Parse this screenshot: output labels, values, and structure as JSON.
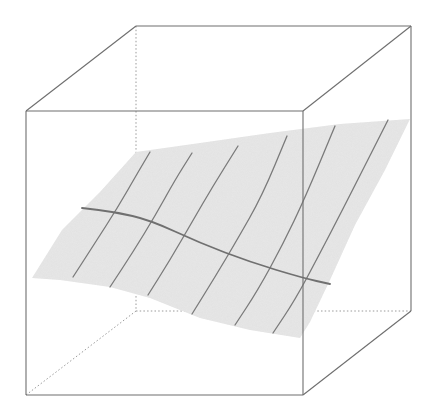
{
  "chart_data": {
    "type": "surface3d",
    "title": "",
    "xlabel": "",
    "ylabel": "",
    "zlabel": "",
    "axes_visible": false,
    "grid": false,
    "legend": null,
    "box": {
      "style": "wireframe",
      "front_top_left": [
        26,
        111
      ],
      "front_top_right": [
        303,
        111
      ],
      "front_bottom_left": [
        26,
        395
      ],
      "front_bottom_right": [
        303,
        395
      ],
      "back_top_left": [
        136,
        26
      ],
      "back_top_right": [
        411,
        26
      ],
      "back_bottom_left": [
        136,
        311
      ],
      "back_bottom_right": [
        411,
        311
      ],
      "hidden_edges": "dotted"
    },
    "surface": {
      "description": "Gently tilted, slightly wavy sheet rising from front-left to back-right",
      "outline": [
        [
          32,
          278
        ],
        [
          62,
          230
        ],
        [
          100,
          192
        ],
        [
          136,
          152
        ],
        [
          200,
          143
        ],
        [
          270,
          133
        ],
        [
          340,
          124
        ],
        [
          410,
          119
        ],
        [
          385,
          170
        ],
        [
          355,
          225
        ],
        [
          330,
          280
        ],
        [
          310,
          322
        ],
        [
          300,
          338
        ],
        [
          250,
          330
        ],
        [
          200,
          318
        ],
        [
          150,
          298
        ],
        [
          110,
          287
        ],
        [
          60,
          280
        ]
      ],
      "meridian_lines": [
        [
          [
            73,
            277
          ],
          [
            95,
            243
          ],
          [
            118,
            207
          ],
          [
            137,
            174
          ],
          [
            150,
            152
          ]
        ],
        [
          [
            110,
            287
          ],
          [
            133,
            252
          ],
          [
            155,
            216
          ],
          [
            175,
            180
          ],
          [
            192,
            153
          ]
        ],
        [
          [
            148,
            295
          ],
          [
            170,
            260
          ],
          [
            192,
            222
          ],
          [
            213,
            186
          ],
          [
            238,
            146
          ]
        ],
        [
          [
            192,
            314
          ],
          [
            215,
            277
          ],
          [
            237,
            240
          ],
          [
            262,
            196
          ],
          [
            287,
            136
          ]
        ],
        [
          [
            235,
            325
          ],
          [
            258,
            290
          ],
          [
            283,
            244
          ],
          [
            305,
            198
          ],
          [
            335,
            126
          ]
        ],
        [
          [
            273,
            333
          ],
          [
            295,
            300
          ],
          [
            318,
            257
          ],
          [
            345,
            205
          ],
          [
            388,
            120
          ]
        ]
      ],
      "main_transverse_line": [
        [
          82,
          208
        ],
        [
          115,
          212
        ],
        [
          150,
          220
        ],
        [
          200,
          243
        ],
        [
          250,
          262
        ],
        [
          303,
          278
        ],
        [
          330,
          284
        ]
      ]
    },
    "colors": {
      "box_edge": "#6e6e6e",
      "hidden_edge": "#9a9a9a",
      "surface": "#e8e8e8",
      "mesh_line": "#7a7a7a",
      "main_line": "#707070",
      "background": "#ffffff"
    }
  }
}
